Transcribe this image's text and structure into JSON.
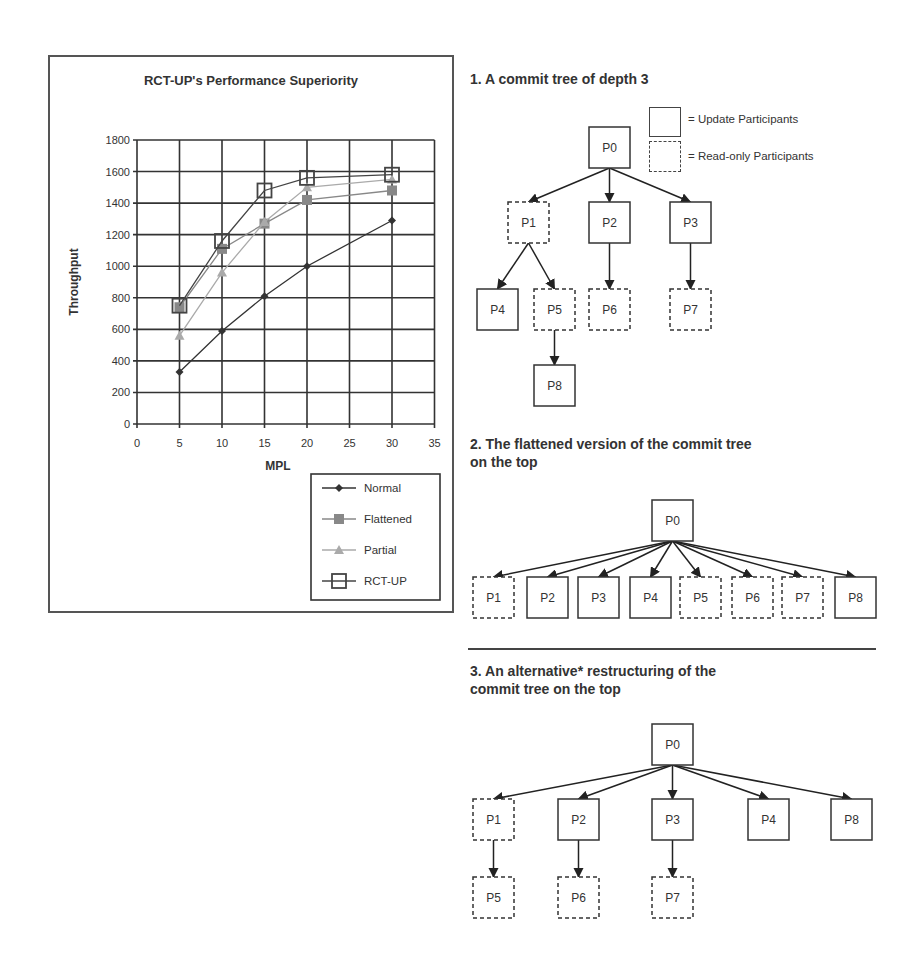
{
  "chart_data": {
    "type": "line",
    "title": "RCT-UP's Performance Superiority",
    "xlabel": "MPL",
    "ylabel": "Throughput",
    "x": [
      5,
      10,
      15,
      20,
      30
    ],
    "xlim": [
      0,
      35
    ],
    "ylim": [
      0,
      1800
    ],
    "xticks": [
      "0",
      "5",
      "10",
      "15",
      "20",
      "25",
      "30",
      "35"
    ],
    "yticks": [
      "0",
      "200",
      "400",
      "600",
      "800",
      "1000",
      "1200",
      "1400",
      "1600",
      "1800"
    ],
    "grid": true,
    "legend_position": "bottom-right",
    "series": [
      {
        "name": "Normal",
        "marker": "diamond",
        "color": "#333333",
        "values": [
          330,
          590,
          810,
          1000,
          1290
        ]
      },
      {
        "name": "Flattened",
        "marker": "square",
        "color": "#888888",
        "values": [
          740,
          1110,
          1270,
          1420,
          1480
        ]
      },
      {
        "name": "Partial",
        "marker": "triangle",
        "color": "#aaaaaa",
        "values": [
          560,
          960,
          1280,
          1500,
          1550
        ]
      },
      {
        "name": "RCT-UP",
        "marker": "open-square",
        "color": "#444444",
        "values": [
          750,
          1160,
          1480,
          1560,
          1580
        ]
      }
    ]
  },
  "diagrams": {
    "legend": {
      "update": "= Update Participants",
      "readonly": "= Read-only Participants"
    },
    "tree1": {
      "heading": "1. A commit tree of depth 3",
      "nodes": [
        {
          "id": "P0",
          "x": 589,
          "y": 127,
          "dashed": false
        },
        {
          "id": "P1",
          "x": 508,
          "y": 202,
          "dashed": true
        },
        {
          "id": "P2",
          "x": 589,
          "y": 202,
          "dashed": false
        },
        {
          "id": "P3",
          "x": 670,
          "y": 202,
          "dashed": false
        },
        {
          "id": "P4",
          "x": 477,
          "y": 289,
          "dashed": false
        },
        {
          "id": "P5",
          "x": 534,
          "y": 289,
          "dashed": true
        },
        {
          "id": "P6",
          "x": 589,
          "y": 289,
          "dashed": true
        },
        {
          "id": "P7",
          "x": 670,
          "y": 289,
          "dashed": true
        },
        {
          "id": "P8",
          "x": 534,
          "y": 365,
          "dashed": false
        }
      ],
      "edges": [
        [
          "P0",
          "P1"
        ],
        [
          "P0",
          "P2"
        ],
        [
          "P0",
          "P3"
        ],
        [
          "P1",
          "P4"
        ],
        [
          "P1",
          "P5"
        ],
        [
          "P2",
          "P6"
        ],
        [
          "P3",
          "P7"
        ],
        [
          "P5",
          "P8"
        ]
      ]
    },
    "tree2": {
      "heading_line1": "2. The flattened version of the commit tree",
      "heading_line2": "on the  top",
      "nodes": [
        {
          "id": "P0",
          "x": 652,
          "y": 500,
          "dashed": false
        },
        {
          "id": "P1",
          "x": 473,
          "y": 577,
          "dashed": true
        },
        {
          "id": "P2",
          "x": 527,
          "y": 577,
          "dashed": false
        },
        {
          "id": "P3",
          "x": 578,
          "y": 577,
          "dashed": false
        },
        {
          "id": "P4",
          "x": 630,
          "y": 577,
          "dashed": false
        },
        {
          "id": "P5",
          "x": 680,
          "y": 577,
          "dashed": true
        },
        {
          "id": "P6",
          "x": 732,
          "y": 577,
          "dashed": true
        },
        {
          "id": "P7",
          "x": 782,
          "y": 577,
          "dashed": true
        },
        {
          "id": "P8",
          "x": 835,
          "y": 577,
          "dashed": false
        }
      ],
      "edges": [
        [
          "P0",
          "P1"
        ],
        [
          "P0",
          "P2"
        ],
        [
          "P0",
          "P3"
        ],
        [
          "P0",
          "P4"
        ],
        [
          "P0",
          "P5"
        ],
        [
          "P0",
          "P6"
        ],
        [
          "P0",
          "P7"
        ],
        [
          "P0",
          "P8"
        ]
      ]
    },
    "tree3": {
      "heading_line1": "3. An alternative* restructuring of the",
      "heading_line2": "commit tree on the  top",
      "nodes": [
        {
          "id": "P0",
          "x": 652,
          "y": 724,
          "dashed": false
        },
        {
          "id": "P1",
          "x": 473,
          "y": 799,
          "dashed": true
        },
        {
          "id": "P2",
          "x": 558,
          "y": 799,
          "dashed": false
        },
        {
          "id": "P3",
          "x": 652,
          "y": 799,
          "dashed": false
        },
        {
          "id": "P4",
          "x": 748,
          "y": 799,
          "dashed": false
        },
        {
          "id": "P8",
          "x": 831,
          "y": 799,
          "dashed": false
        },
        {
          "id": "P5",
          "x": 473,
          "y": 877,
          "dashed": true
        },
        {
          "id": "P6",
          "x": 558,
          "y": 877,
          "dashed": true
        },
        {
          "id": "P7",
          "x": 652,
          "y": 877,
          "dashed": true
        }
      ],
      "edges": [
        [
          "P0",
          "P1"
        ],
        [
          "P0",
          "P2"
        ],
        [
          "P0",
          "P3"
        ],
        [
          "P0",
          "P4"
        ],
        [
          "P0",
          "P8"
        ],
        [
          "P1",
          "P5"
        ],
        [
          "P2",
          "P6"
        ],
        [
          "P3",
          "P7"
        ]
      ]
    }
  }
}
